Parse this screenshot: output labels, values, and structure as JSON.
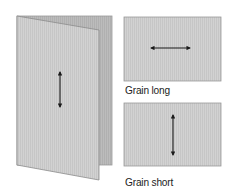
{
  "diagram": {
    "folded_card": {
      "grain_direction": "vertical",
      "back_color": "#b8b8b8",
      "front_color": "#d4d4d4"
    },
    "panels": [
      {
        "id": "grain-long",
        "label": "Grain long",
        "arrow": "horizontal"
      },
      {
        "id": "grain-short",
        "label": "Grain short",
        "arrow": "vertical"
      }
    ],
    "colors": {
      "panel_fill": "#cfcfcf",
      "panel_border": "#9a9a9a",
      "arrow": "#1a1a1a"
    }
  }
}
